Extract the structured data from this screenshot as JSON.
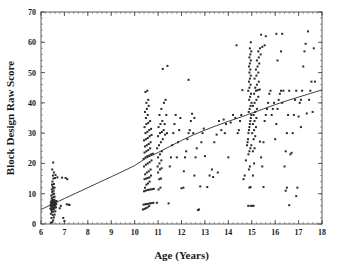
{
  "figure": {
    "background_color": "#ffffff",
    "ink_color": "#2b2b2b",
    "frame_color": "#4a4a4a"
  },
  "chart_data": {
    "type": "scatter",
    "title": "",
    "xlabel": "Age (Years)",
    "ylabel": "Block Design Raw Score",
    "xlim": [
      6,
      18
    ],
    "ylim": [
      0,
      70
    ],
    "xticks": [
      6,
      7,
      8,
      9,
      10,
      11,
      12,
      13,
      14,
      15,
      16,
      17,
      18
    ],
    "yticks": [
      0,
      10,
      20,
      30,
      40,
      50,
      60,
      70
    ],
    "xtick_labels": [
      "6",
      "7",
      "8",
      "9",
      "10",
      "11",
      "12",
      "13",
      "14",
      "15",
      "16",
      "17",
      "18"
    ],
    "ytick_labels": [
      "0",
      "10",
      "20",
      "30",
      "40",
      "50",
      "60",
      "70"
    ],
    "x_minor_tick_step": 0.2,
    "y_minor_tick_step": 2,
    "grid": false,
    "legend": null,
    "legend_position": "none",
    "marker": "dot",
    "marker_size": 1.3,
    "fit_line": {
      "label": "fitted regression curve",
      "shape": "concave-increasing",
      "points": [
        [
          6.0,
          4.8
        ],
        [
          6.5,
          6.6
        ],
        [
          7.0,
          8.4
        ],
        [
          7.5,
          10.2
        ],
        [
          8.0,
          12.0
        ],
        [
          8.5,
          13.8
        ],
        [
          9.0,
          15.6
        ],
        [
          9.5,
          17.4
        ],
        [
          10.0,
          19.3
        ],
        [
          10.5,
          21.8
        ],
        [
          11.0,
          23.6
        ],
        [
          11.5,
          25.6
        ],
        [
          12.0,
          27.6
        ],
        [
          12.5,
          29.4
        ],
        [
          13.0,
          31.0
        ],
        [
          13.5,
          32.5
        ],
        [
          14.0,
          33.9
        ],
        [
          14.5,
          35.2
        ],
        [
          15.0,
          36.6
        ],
        [
          15.5,
          38.0
        ],
        [
          16.0,
          39.4
        ],
        [
          16.5,
          40.7
        ],
        [
          17.0,
          41.9
        ],
        [
          17.5,
          43.1
        ],
        [
          18.0,
          44.3
        ]
      ]
    },
    "points": [
      [
        6.42,
        0.4
      ],
      [
        6.48,
        0.6
      ],
      [
        6.52,
        1.2
      ],
      [
        6.45,
        2.0
      ],
      [
        6.55,
        2.2
      ],
      [
        6.5,
        3.0
      ],
      [
        6.58,
        3.1
      ],
      [
        6.42,
        3.4
      ],
      [
        6.47,
        4.0
      ],
      [
        6.53,
        4.1
      ],
      [
        6.61,
        4.2
      ],
      [
        6.44,
        4.6
      ],
      [
        6.5,
        4.8
      ],
      [
        6.56,
        5.0
      ],
      [
        6.4,
        5.1
      ],
      [
        6.46,
        5.2
      ],
      [
        6.52,
        5.3
      ],
      [
        6.58,
        5.4
      ],
      [
        6.64,
        5.5
      ],
      [
        6.43,
        5.8
      ],
      [
        6.49,
        5.9
      ],
      [
        6.55,
        6.0
      ],
      [
        6.61,
        6.1
      ],
      [
        6.41,
        6.2
      ],
      [
        6.47,
        6.3
      ],
      [
        6.53,
        6.4
      ],
      [
        6.59,
        6.5
      ],
      [
        6.65,
        6.6
      ],
      [
        6.44,
        6.8
      ],
      [
        6.5,
        6.9
      ],
      [
        6.56,
        7.0
      ],
      [
        6.62,
        7.1
      ],
      [
        6.42,
        7.2
      ],
      [
        6.48,
        7.3
      ],
      [
        6.54,
        7.4
      ],
      [
        6.6,
        7.5
      ],
      [
        6.66,
        7.6
      ],
      [
        6.45,
        7.8
      ],
      [
        6.51,
        7.9
      ],
      [
        6.57,
        8.0
      ],
      [
        6.46,
        8.5
      ],
      [
        6.52,
        8.8
      ],
      [
        6.58,
        9.0
      ],
      [
        6.44,
        9.4
      ],
      [
        6.5,
        9.8
      ],
      [
        6.56,
        10.0
      ],
      [
        6.48,
        10.6
      ],
      [
        6.54,
        11.0
      ],
      [
        6.46,
        11.4
      ],
      [
        6.52,
        11.8
      ],
      [
        6.58,
        12.0
      ],
      [
        6.5,
        12.3
      ],
      [
        6.47,
        13.0
      ],
      [
        6.55,
        13.2
      ],
      [
        6.49,
        14.0
      ],
      [
        6.53,
        15.0
      ],
      [
        6.6,
        15.2
      ],
      [
        6.7,
        15.4
      ],
      [
        6.51,
        16.0
      ],
      [
        6.62,
        16.2
      ],
      [
        6.55,
        17.0
      ],
      [
        6.48,
        18.0
      ],
      [
        6.52,
        20.3
      ],
      [
        6.9,
        15.3
      ],
      [
        7.05,
        15.2
      ],
      [
        7.12,
        14.8
      ],
      [
        7.18,
        6.4
      ],
      [
        7.22,
        6.3
      ],
      [
        6.95,
        2.0
      ],
      [
        7.0,
        1.0
      ],
      [
        6.8,
        5.2
      ],
      [
        6.85,
        6.0
      ],
      [
        7.1,
        6.5
      ],
      [
        10.35,
        4.8
      ],
      [
        10.42,
        5.0
      ],
      [
        10.48,
        5.2
      ],
      [
        10.55,
        5.5
      ],
      [
        10.62,
        5.9
      ],
      [
        10.38,
        6.4
      ],
      [
        10.45,
        6.5
      ],
      [
        10.52,
        6.6
      ],
      [
        10.59,
        6.7
      ],
      [
        10.66,
        6.8
      ],
      [
        10.73,
        6.9
      ],
      [
        10.8,
        7.0
      ],
      [
        10.4,
        10.8
      ],
      [
        10.47,
        11.0
      ],
      [
        10.54,
        11.2
      ],
      [
        10.61,
        11.3
      ],
      [
        10.68,
        11.4
      ],
      [
        10.75,
        11.5
      ],
      [
        10.82,
        11.6
      ],
      [
        10.44,
        12.0
      ],
      [
        10.5,
        13.0
      ],
      [
        10.57,
        13.4
      ],
      [
        10.64,
        14.0
      ],
      [
        10.42,
        14.8
      ],
      [
        10.49,
        15.0
      ],
      [
        10.56,
        15.2
      ],
      [
        10.63,
        15.4
      ],
      [
        10.7,
        16.0
      ],
      [
        10.45,
        16.4
      ],
      [
        10.52,
        17.0
      ],
      [
        10.6,
        17.4
      ],
      [
        10.68,
        18.0
      ],
      [
        10.4,
        19.0
      ],
      [
        10.48,
        19.6
      ],
      [
        10.56,
        20.0
      ],
      [
        10.64,
        20.4
      ],
      [
        10.72,
        21.0
      ],
      [
        10.38,
        21.5
      ],
      [
        10.46,
        22.0
      ],
      [
        10.54,
        22.4
      ],
      [
        10.62,
        22.6
      ],
      [
        10.7,
        23.0
      ],
      [
        10.78,
        23.2
      ],
      [
        10.42,
        23.6
      ],
      [
        10.5,
        24.0
      ],
      [
        10.58,
        24.4
      ],
      [
        10.66,
        25.0
      ],
      [
        10.44,
        25.6
      ],
      [
        10.52,
        26.0
      ],
      [
        10.6,
        26.4
      ],
      [
        10.68,
        27.0
      ],
      [
        10.4,
        27.6
      ],
      [
        10.48,
        28.0
      ],
      [
        10.56,
        28.4
      ],
      [
        10.64,
        29.0
      ],
      [
        10.72,
        29.4
      ],
      [
        10.46,
        30.0
      ],
      [
        10.54,
        30.4
      ],
      [
        10.62,
        31.0
      ],
      [
        10.7,
        31.4
      ],
      [
        10.42,
        32.0
      ],
      [
        10.5,
        33.0
      ],
      [
        10.58,
        33.4
      ],
      [
        10.66,
        34.0
      ],
      [
        10.48,
        35.0
      ],
      [
        10.56,
        36.0
      ],
      [
        10.44,
        37.0
      ],
      [
        10.52,
        38.0
      ],
      [
        10.6,
        39.0
      ],
      [
        10.5,
        40.0
      ],
      [
        10.58,
        41.0
      ],
      [
        10.46,
        43.6
      ],
      [
        10.54,
        44.0
      ],
      [
        10.95,
        7.0
      ],
      [
        11.02,
        11.4
      ],
      [
        11.1,
        12.0
      ],
      [
        11.05,
        14.8
      ],
      [
        11.12,
        15.0
      ],
      [
        11.0,
        17.0
      ],
      [
        11.08,
        18.0
      ],
      [
        11.15,
        18.4
      ],
      [
        10.98,
        19.0
      ],
      [
        11.06,
        20.0
      ],
      [
        11.14,
        21.0
      ],
      [
        11.0,
        22.0
      ],
      [
        11.08,
        23.0
      ],
      [
        11.16,
        24.0
      ],
      [
        10.96,
        25.0
      ],
      [
        11.04,
        26.0
      ],
      [
        11.12,
        27.0
      ],
      [
        11.2,
        28.0
      ],
      [
        11.0,
        29.0
      ],
      [
        11.08,
        30.0
      ],
      [
        11.16,
        30.4
      ],
      [
        11.24,
        31.0
      ],
      [
        11.02,
        32.0
      ],
      [
        11.1,
        33.0
      ],
      [
        11.18,
        34.0
      ],
      [
        11.06,
        36.0
      ],
      [
        11.14,
        38.0
      ],
      [
        11.3,
        29.5
      ],
      [
        11.38,
        30.0
      ],
      [
        11.28,
        33.0
      ],
      [
        11.35,
        36.0
      ],
      [
        11.25,
        40.0
      ],
      [
        11.32,
        41.0
      ],
      [
        11.2,
        51.2
      ],
      [
        11.4,
        52.2
      ],
      [
        11.45,
        6.8
      ],
      [
        11.5,
        19.0
      ],
      [
        11.55,
        22.0
      ],
      [
        11.6,
        26.0
      ],
      [
        11.65,
        30.0
      ],
      [
        11.7,
        33.0
      ],
      [
        11.75,
        36.0
      ],
      [
        11.8,
        22.0
      ],
      [
        11.85,
        27.0
      ],
      [
        11.9,
        31.0
      ],
      [
        11.95,
        35.0
      ],
      [
        12.0,
        11.8
      ],
      [
        12.08,
        12.0
      ],
      [
        12.15,
        22.0
      ],
      [
        12.2,
        24.0
      ],
      [
        12.25,
        28.0
      ],
      [
        12.3,
        30.0
      ],
      [
        12.35,
        31.0
      ],
      [
        12.4,
        34.0
      ],
      [
        12.45,
        36.4
      ],
      [
        12.5,
        30.0
      ],
      [
        12.55,
        35.0
      ],
      [
        12.6,
        22.0
      ],
      [
        12.65,
        25.0
      ],
      [
        12.7,
        4.6
      ],
      [
        12.75,
        4.8
      ],
      [
        12.8,
        12.4
      ],
      [
        12.3,
        47.6
      ],
      [
        12.1,
        17.4
      ],
      [
        12.55,
        16.0
      ],
      [
        12.85,
        27.0
      ],
      [
        12.9,
        30.0
      ],
      [
        12.95,
        31.5
      ],
      [
        13.0,
        22.4
      ],
      [
        13.1,
        12.2
      ],
      [
        13.2,
        16.0
      ],
      [
        13.3,
        18.0
      ],
      [
        13.4,
        27.0
      ],
      [
        13.5,
        29.5
      ],
      [
        13.6,
        34.0
      ],
      [
        13.7,
        31.0
      ],
      [
        13.8,
        34.5
      ],
      [
        13.9,
        33.0
      ],
      [
        13.35,
        15.5
      ],
      [
        13.55,
        17.0
      ],
      [
        13.85,
        30.0
      ],
      [
        14.0,
        22.0
      ],
      [
        14.1,
        33.5
      ],
      [
        14.2,
        36.0
      ],
      [
        14.3,
        35.0
      ],
      [
        14.35,
        59.0
      ],
      [
        14.4,
        30.0
      ],
      [
        14.45,
        31.0
      ],
      [
        14.5,
        34.0
      ],
      [
        14.55,
        36.0
      ],
      [
        14.6,
        44.2
      ],
      [
        14.65,
        14.8
      ],
      [
        14.7,
        16.0
      ],
      [
        14.75,
        21.0
      ],
      [
        14.8,
        26.0
      ],
      [
        14.82,
        27.0
      ],
      [
        14.84,
        28.0
      ],
      [
        14.86,
        30.0
      ],
      [
        14.88,
        31.0
      ],
      [
        14.9,
        32.0
      ],
      [
        14.92,
        33.0
      ],
      [
        14.94,
        34.0
      ],
      [
        14.96,
        35.0
      ],
      [
        14.98,
        36.0
      ],
      [
        14.85,
        6.0
      ],
      [
        14.95,
        6.0
      ],
      [
        14.9,
        12.0
      ],
      [
        14.95,
        12.2
      ],
      [
        14.88,
        18.0
      ],
      [
        14.92,
        19.0
      ],
      [
        14.86,
        23.0
      ],
      [
        14.9,
        24.0
      ],
      [
        14.94,
        25.0
      ],
      [
        14.98,
        26.0
      ],
      [
        14.87,
        37.0
      ],
      [
        14.91,
        38.0
      ],
      [
        14.95,
        39.0
      ],
      [
        14.99,
        40.0
      ],
      [
        14.89,
        41.0
      ],
      [
        14.93,
        42.0
      ],
      [
        14.97,
        43.0
      ],
      [
        14.85,
        44.0
      ],
      [
        14.9,
        45.0
      ],
      [
        14.95,
        46.0
      ],
      [
        14.88,
        47.0
      ],
      [
        14.92,
        48.0
      ],
      [
        14.96,
        49.0
      ],
      [
        14.9,
        50.0
      ],
      [
        14.94,
        51.0
      ],
      [
        14.88,
        52.0
      ],
      [
        14.92,
        53.0
      ],
      [
        14.96,
        54.0
      ],
      [
        14.9,
        55.0
      ],
      [
        14.94,
        56.0
      ],
      [
        14.98,
        57.0
      ],
      [
        14.92,
        58.0
      ],
      [
        14.96,
        60.0
      ],
      [
        15.02,
        6.0
      ],
      [
        15.08,
        6.0
      ],
      [
        15.05,
        16.0
      ],
      [
        15.1,
        20.0
      ],
      [
        15.05,
        24.0
      ],
      [
        15.12,
        25.0
      ],
      [
        15.08,
        28.0
      ],
      [
        15.15,
        29.0
      ],
      [
        15.02,
        30.0
      ],
      [
        15.1,
        31.0
      ],
      [
        15.18,
        32.0
      ],
      [
        15.05,
        33.0
      ],
      [
        15.12,
        34.0
      ],
      [
        15.2,
        35.0
      ],
      [
        15.08,
        36.0
      ],
      [
        15.15,
        37.0
      ],
      [
        15.22,
        38.0
      ],
      [
        15.05,
        39.0
      ],
      [
        15.12,
        40.0
      ],
      [
        15.2,
        41.0
      ],
      [
        15.28,
        42.0
      ],
      [
        15.1,
        43.0
      ],
      [
        15.18,
        44.0
      ],
      [
        15.26,
        44.2
      ],
      [
        15.34,
        44.4
      ],
      [
        15.15,
        45.0
      ],
      [
        15.22,
        46.0
      ],
      [
        15.3,
        47.0
      ],
      [
        15.12,
        48.0
      ],
      [
        15.2,
        49.0
      ],
      [
        15.28,
        50.0
      ],
      [
        15.18,
        51.0
      ],
      [
        15.25,
        52.0
      ],
      [
        15.32,
        53.0
      ],
      [
        15.22,
        54.0
      ],
      [
        15.3,
        55.0
      ],
      [
        15.38,
        56.0
      ],
      [
        15.28,
        57.0
      ],
      [
        15.35,
        58.0
      ],
      [
        15.45,
        58.5
      ],
      [
        15.55,
        59.0
      ],
      [
        15.4,
        62.5
      ],
      [
        15.6,
        62.0
      ],
      [
        15.4,
        22.0
      ],
      [
        15.5,
        27.0
      ],
      [
        15.55,
        34.0
      ],
      [
        15.6,
        36.0
      ],
      [
        15.65,
        38.0
      ],
      [
        15.7,
        40.0
      ],
      [
        15.75,
        43.0
      ],
      [
        15.8,
        44.0
      ],
      [
        15.85,
        36.0
      ],
      [
        15.9,
        38.0
      ],
      [
        15.95,
        40.0
      ],
      [
        15.5,
        12.2
      ],
      [
        15.45,
        19.0
      ],
      [
        15.35,
        27.2
      ],
      [
        16.0,
        28.0
      ],
      [
        16.05,
        33.0
      ],
      [
        16.1,
        38.0
      ],
      [
        16.15,
        41.0
      ],
      [
        16.2,
        43.0
      ],
      [
        16.25,
        44.0
      ],
      [
        16.3,
        40.0
      ],
      [
        16.35,
        44.0
      ],
      [
        16.4,
        19.0
      ],
      [
        16.45,
        24.0
      ],
      [
        16.5,
        30.0
      ],
      [
        16.55,
        36.0
      ],
      [
        16.6,
        44.0
      ],
      [
        16.65,
        23.0
      ],
      [
        16.7,
        23.5
      ],
      [
        16.75,
        30.0
      ],
      [
        16.8,
        36.0
      ],
      [
        16.85,
        41.0
      ],
      [
        16.9,
        44.0
      ],
      [
        16.05,
        62.8
      ],
      [
        16.3,
        62.8
      ],
      [
        16.25,
        57.0
      ],
      [
        16.1,
        54.0
      ],
      [
        16.45,
        11.0
      ],
      [
        16.5,
        12.0
      ],
      [
        16.6,
        6.2
      ],
      [
        16.9,
        9.2
      ],
      [
        16.95,
        12.0
      ],
      [
        17.0,
        35.5
      ],
      [
        17.05,
        40.0
      ],
      [
        17.1,
        41.0
      ],
      [
        17.15,
        44.0
      ],
      [
        17.2,
        52.0
      ],
      [
        17.25,
        57.0
      ],
      [
        17.3,
        59.5
      ],
      [
        17.4,
        63.6
      ],
      [
        17.45,
        41.0
      ],
      [
        17.5,
        44.0
      ],
      [
        17.55,
        47.0
      ],
      [
        17.6,
        37.0
      ],
      [
        17.65,
        58.0
      ],
      [
        17.7,
        47.0
      ],
      [
        17.1,
        32.0
      ],
      [
        17.35,
        36.5
      ]
    ]
  }
}
